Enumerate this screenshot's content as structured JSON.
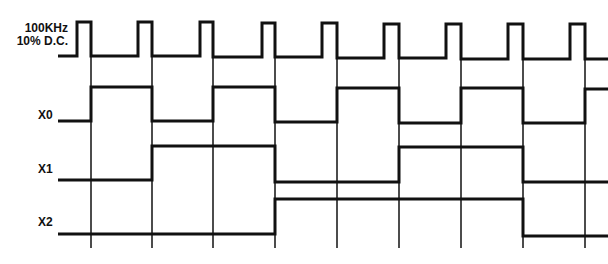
{
  "diagram": {
    "type": "timing-diagram",
    "signals": [
      {
        "name": "clock",
        "label_line1": "100KHz",
        "label_line2": "10% D.C."
      },
      {
        "name": "X0",
        "label": "X0"
      },
      {
        "name": "X1",
        "label": "X1"
      },
      {
        "name": "X2",
        "label": "X2"
      }
    ],
    "clock_falling_edges_px": [
      91,
      152,
      213,
      275,
      337,
      399,
      461,
      523,
      585
    ],
    "clock_rising_edges_px": [
      77,
      138,
      200,
      262,
      322,
      384,
      446,
      508,
      570
    ],
    "line_color": "#111111",
    "background": "#ffffff"
  },
  "labels": {
    "clock_line1": "100KHz",
    "clock_line2": "10% D.C.",
    "x0": "X0",
    "x1": "X1",
    "x2": "X2"
  }
}
